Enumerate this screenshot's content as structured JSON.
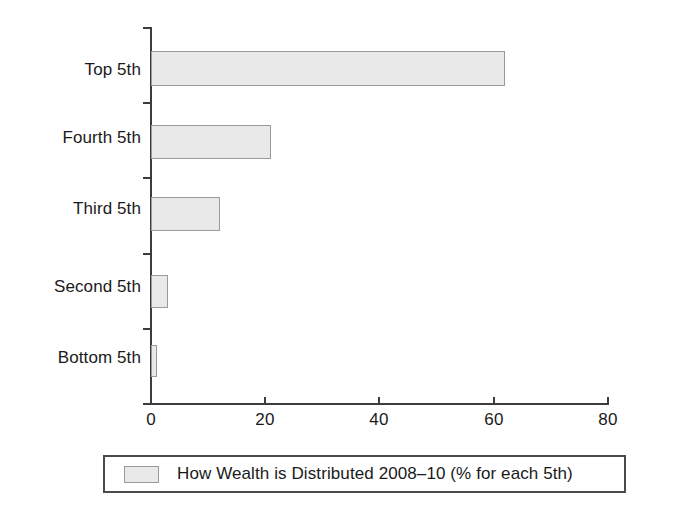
{
  "chart_data": {
    "type": "bar",
    "orientation": "horizontal",
    "title": "",
    "xlabel": "",
    "ylabel": "",
    "categories": [
      "Top 5th",
      "Fourth 5th",
      "Third 5th",
      "Second 5th",
      "Bottom 5th"
    ],
    "values": [
      62,
      21,
      12,
      3,
      1
    ],
    "series": [
      {
        "name": "How Wealth is Distributed 2008–10 (% for each 5th)",
        "values": [
          62,
          21,
          12,
          3,
          1
        ]
      }
    ],
    "xlim": [
      0,
      80
    ],
    "xticks": [
      0,
      20,
      40,
      60,
      80
    ],
    "xtick_labels": [
      "0",
      "20",
      "40",
      "60",
      "80"
    ],
    "grid": false,
    "legend_position": "bottom",
    "bar_fill_color": "#e9e9e9",
    "bar_border_color": "#9a9a9a",
    "axis_color": "#3c3c3c",
    "background_color": "#ffffff"
  },
  "legend": {
    "label": "How Wealth is Distributed 2008–10 (% for each 5th)",
    "swatch_name": "legend-color-swatch"
  }
}
